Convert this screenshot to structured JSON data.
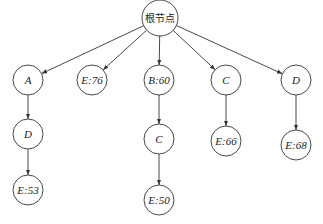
{
  "diagram": {
    "type": "tree",
    "root": {
      "id": "root",
      "label": "根节点",
      "x": 160,
      "y": 18,
      "r": 18
    },
    "nodes": [
      {
        "id": "A",
        "label": "A",
        "x": 28,
        "y": 80,
        "r": 15
      },
      {
        "id": "E76",
        "label": "E:76",
        "x": 92,
        "y": 80,
        "r": 15
      },
      {
        "id": "B60",
        "label": "B:60",
        "x": 159,
        "y": 80,
        "r": 15
      },
      {
        "id": "C1",
        "label": "C",
        "x": 226,
        "y": 80,
        "r": 15
      },
      {
        "id": "D1",
        "label": "D",
        "x": 296,
        "y": 80,
        "r": 15
      },
      {
        "id": "D2",
        "label": "D",
        "x": 28,
        "y": 134,
        "r": 15
      },
      {
        "id": "C2",
        "label": "C",
        "x": 159,
        "y": 139,
        "r": 15
      },
      {
        "id": "E66",
        "label": "E:66",
        "x": 226,
        "y": 141,
        "r": 15
      },
      {
        "id": "E68",
        "label": "E:68",
        "x": 296,
        "y": 145,
        "r": 15
      },
      {
        "id": "E53",
        "label": "E:53",
        "x": 28,
        "y": 190,
        "r": 15
      },
      {
        "id": "E50",
        "label": "E:50",
        "x": 159,
        "y": 200,
        "r": 15
      }
    ],
    "edges": [
      {
        "from": "root",
        "to": "A"
      },
      {
        "from": "root",
        "to": "E76"
      },
      {
        "from": "root",
        "to": "B60"
      },
      {
        "from": "root",
        "to": "C1"
      },
      {
        "from": "root",
        "to": "D1"
      },
      {
        "from": "A",
        "to": "D2"
      },
      {
        "from": "D2",
        "to": "E53"
      },
      {
        "from": "B60",
        "to": "C2"
      },
      {
        "from": "C2",
        "to": "E50"
      },
      {
        "from": "C1",
        "to": "E66"
      },
      {
        "from": "D1",
        "to": "E68"
      }
    ],
    "colors": {
      "stroke": "#333333",
      "fill": "#ffffff",
      "text": "#222222"
    }
  }
}
